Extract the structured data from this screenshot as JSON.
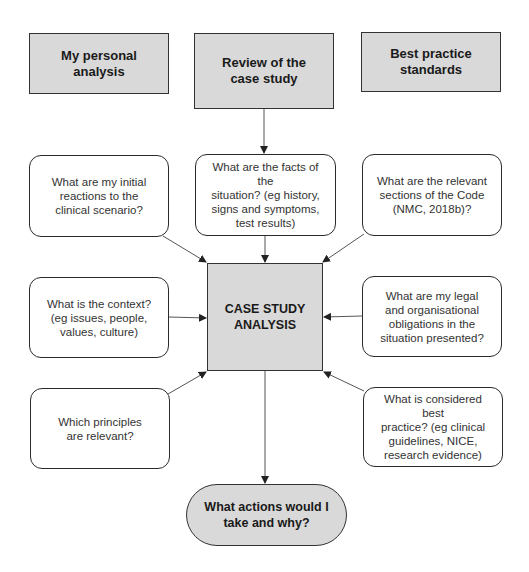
{
  "diagram": {
    "colors": {
      "header_fill": "#d9d9d9",
      "center_fill": "#d9d9d9",
      "terminal_fill": "#d9d9d9",
      "question_fill": "#ffffff",
      "border": "#333333",
      "arrow": "#555555"
    },
    "headers": [
      {
        "id": "personal",
        "label": "My personal\nanalysis"
      },
      {
        "id": "review",
        "label": "Review of the\ncase study"
      },
      {
        "id": "standards",
        "label": "Best practice\nstandards"
      }
    ],
    "questions": [
      {
        "id": "initial-reactions",
        "label": "What are my initial\nreactions to the\nclinical scenario?"
      },
      {
        "id": "facts",
        "label": "What are the facts of the\nsituation? (eg history,\nsigns and symptoms,\ntest results)"
      },
      {
        "id": "code-sections",
        "label": "What are the relevant\nsections of the Code\n(NMC, 2018b)?"
      },
      {
        "id": "context",
        "label": "What is the context?\n(eg issues, people,\nvalues, culture)"
      },
      {
        "id": "legal-obligations",
        "label": "What are my legal\nand organisational\nobligations in the\nsituation presented?"
      },
      {
        "id": "principles",
        "label": "Which principles\nare relevant?"
      },
      {
        "id": "best-practice",
        "label": "What is considered best\npractice? (eg clinical\nguidelines, NICE,\nresearch evidence)"
      }
    ],
    "center": {
      "label": "CASE STUDY\nANALYSIS"
    },
    "terminal": {
      "label": "What actions would I\ntake and why?"
    },
    "edges": [
      {
        "from": "review",
        "to": "facts"
      },
      {
        "from": "initial-reactions",
        "to": "center"
      },
      {
        "from": "facts",
        "to": "center"
      },
      {
        "from": "code-sections",
        "to": "center"
      },
      {
        "from": "context",
        "to": "center"
      },
      {
        "from": "legal-obligations",
        "to": "center"
      },
      {
        "from": "principles",
        "to": "center"
      },
      {
        "from": "best-practice",
        "to": "center"
      },
      {
        "from": "center",
        "to": "terminal"
      }
    ]
  }
}
